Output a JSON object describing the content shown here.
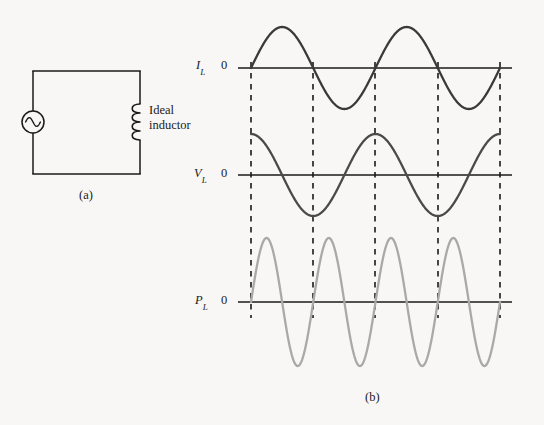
{
  "figure": {
    "background_color": "#f8f7f5",
    "panels": [
      {
        "id": "a",
        "label": "(a)",
        "caption_x": 79,
        "caption_y": 188
      },
      {
        "id": "b",
        "label": "(b)",
        "caption_x": 365,
        "caption_y": 390
      }
    ]
  },
  "circuit": {
    "name": "ac-inductor-circuit",
    "wire_color": "#1a1a1a",
    "loop": {
      "left": 33,
      "right": 140,
      "top": 71,
      "bottom": 174
    },
    "source": {
      "type": "ac-source",
      "cx": 33,
      "cy": 122,
      "r": 11,
      "symbol": "sine-wave"
    },
    "inductor": {
      "type": "inductor",
      "x": 140,
      "y_top": 104,
      "y_bottom": 140,
      "coil_count": 4,
      "label_lines": [
        "Ideal",
        "inductor"
      ],
      "label_x": 149,
      "label_y": 103
    }
  },
  "waveforms": {
    "axis_color": "#1a1a1a",
    "dashed_color": "#1a1a1a",
    "axis_x_start": 238,
    "axis_x_end": 512,
    "curve_x_start": 251,
    "curve_x_end": 500,
    "dashed_lines_x": [
      251,
      313,
      375,
      438,
      500
    ],
    "dashed_top": 62,
    "dashed_bottom": 318,
    "traces": [
      {
        "name": "current-trace",
        "symbol": "I",
        "subscript": "L",
        "zero_label": "0",
        "axis_y": 68,
        "amplitude": 41,
        "cycles": 2,
        "phase_deg": 0,
        "shape": "sine",
        "color": "#3a3a3a",
        "stroke_width": 2.3,
        "label_x": 196,
        "label_y": 58
      },
      {
        "name": "voltage-trace",
        "symbol": "V",
        "subscript": "L",
        "zero_label": "0",
        "axis_y": 175,
        "amplitude": 41,
        "cycles": 2,
        "phase_deg": 90,
        "shape": "cosine",
        "color": "#4a4a4a",
        "stroke_width": 2.3,
        "label_x": 194,
        "label_y": 166
      },
      {
        "name": "power-trace",
        "symbol": "P",
        "subscript": "L",
        "zero_label": "0",
        "axis_y": 302,
        "amplitude": 64,
        "cycles": 4,
        "phase_deg": 0,
        "shape": "sine",
        "color": "#a9a9a9",
        "stroke_width": 2.3,
        "label_x": 195,
        "label_y": 293
      }
    ]
  },
  "chart_data": {
    "type": "line",
    "title": "",
    "xlabel": "",
    "ylabel": "",
    "grid": false,
    "legend": "none",
    "x_domain": [
      0,
      2
    ],
    "x_unit": "periods",
    "annotations": [
      "(a)",
      "(b)",
      "Ideal inductor"
    ],
    "series": [
      {
        "name": "I_L",
        "display": "I_L",
        "equation": "I_L = I_max * sin(2*pi*t/T)",
        "amplitude": 1.0,
        "frequency_cycles": 2,
        "phase_deg": 0,
        "color": "#3a3a3a",
        "zero_crossings_t": [
          0,
          0.5,
          1.0,
          1.5,
          2.0
        ],
        "peaks_t": [
          0.25,
          1.25
        ],
        "troughs_t": [
          0.75,
          1.75
        ]
      },
      {
        "name": "V_L",
        "display": "V_L",
        "equation": "V_L = V_max * cos(2*pi*t/T)",
        "amplitude": 1.0,
        "frequency_cycles": 2,
        "phase_deg": 90,
        "color": "#4a4a4a",
        "zero_crossings_t": [
          0.25,
          0.75,
          1.25,
          1.75
        ],
        "peaks_t": [
          0,
          1.0,
          2.0
        ],
        "troughs_t": [
          0.5,
          1.5
        ]
      },
      {
        "name": "P_L",
        "display": "P_L",
        "equation": "P_L = V_L * I_L = (1/2) P_max * sin(4*pi*t/T)",
        "amplitude": 1.0,
        "frequency_cycles": 4,
        "phase_deg": 0,
        "color": "#a9a9a9",
        "zero_crossings_t": [
          0,
          0.25,
          0.5,
          0.75,
          1.0,
          1.25,
          1.5,
          1.75,
          2.0
        ],
        "peaks_t": [
          0.125,
          0.625,
          1.125,
          1.625
        ],
        "troughs_t": [
          0.375,
          0.875,
          1.375,
          1.875
        ]
      }
    ]
  }
}
